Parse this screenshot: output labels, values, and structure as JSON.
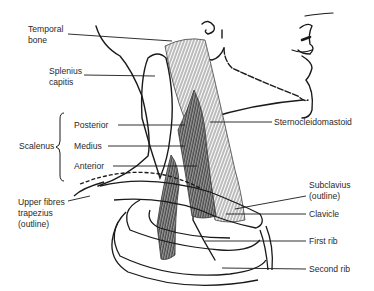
{
  "diagram": {
    "labels": {
      "temporal_bone_1": "Temporal",
      "temporal_bone_2": "bone",
      "splenius_1": "Splenius",
      "splenius_2": "capitis",
      "scalenus": "Scalenus",
      "posterior": "Posterior",
      "medius": "Medius",
      "anterior": "Anterior",
      "trapezius_1": "Upper fibres",
      "trapezius_2": "trapezius",
      "trapezius_3": "(outline)",
      "sternocleidomastoid": "Sternocleidomastoid",
      "subclavius_1": "Subclavius",
      "subclavius_2": "(outline)",
      "clavicle": "Clavicle",
      "first_rib": "First rib",
      "second_rib": "Second rib"
    },
    "colors": {
      "ink": "#1a1a1a",
      "muscle_fill": "#6a6a6a",
      "background": "#ffffff"
    }
  }
}
